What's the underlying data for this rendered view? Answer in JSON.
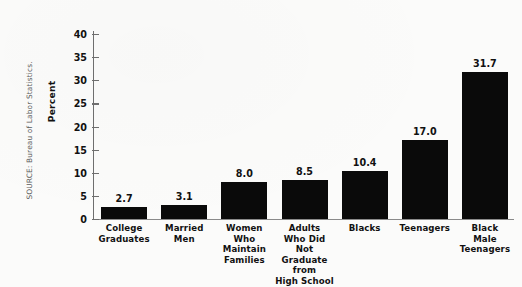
{
  "source_note": "SOURCE: Bureau of Labor Statistics.",
  "chart_data": {
    "type": "bar",
    "title": "",
    "xlabel": "",
    "ylabel": "Percent",
    "ylim": [
      0,
      40
    ],
    "ytick_labels": [
      "0",
      "5",
      "10",
      "15",
      "20",
      "25",
      "30",
      "35",
      "40"
    ],
    "yticks": [
      0,
      5,
      10,
      15,
      20,
      25,
      30,
      35,
      40
    ],
    "grid": false,
    "legend": false,
    "bar_color": "#0a0a0a",
    "categories": [
      "College Graduates",
      "Married Men",
      "Women Who Maintain Families",
      "Adults Who Did Not Graduate from High School",
      "Blacks",
      "Teenagers",
      "Black Male Teenagers"
    ],
    "category_lines": [
      [
        "College",
        "Graduates"
      ],
      [
        "Married",
        "Men"
      ],
      [
        "Women",
        "Who",
        "Maintain",
        "Families"
      ],
      [
        "Adults",
        "Who Did Not",
        "Graduate from",
        "High School"
      ],
      [
        "Blacks"
      ],
      [
        "Teenagers"
      ],
      [
        "Black",
        "Male",
        "Teenagers"
      ]
    ],
    "values": [
      2.7,
      3.1,
      8.0,
      8.5,
      10.4,
      17.0,
      31.7
    ],
    "value_labels": [
      "2.7",
      "3.1",
      "8.0",
      "8.5",
      "10.4",
      "17.0",
      "31.7"
    ]
  }
}
